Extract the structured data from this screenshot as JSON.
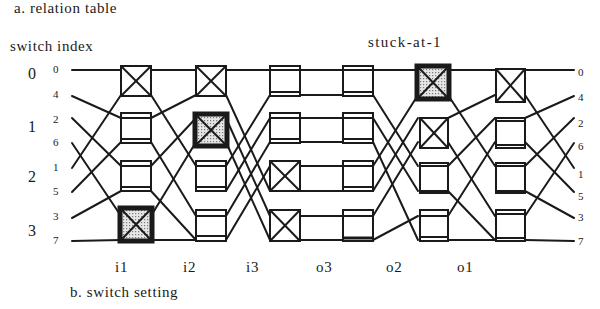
{
  "titles": {
    "relation_table": "a. relation table",
    "switch_index": "switch index",
    "fault": "stuck-at-1",
    "switch_setting": "b. switch setting"
  },
  "switch_indices": [
    "0",
    "1",
    "2",
    "3"
  ],
  "left_wire_labels": [
    "0",
    "4",
    "2",
    "6",
    "1",
    "5",
    "3",
    "7"
  ],
  "right_wire_labels": [
    "0",
    "4",
    "2",
    "6",
    "1",
    "5",
    "3",
    "7"
  ],
  "stages": [
    "i1",
    "i2",
    "i3",
    "o3",
    "o2",
    "o1"
  ],
  "switch_states": {
    "i1": [
      "cross",
      "straight",
      "straight",
      "cross-faulty"
    ],
    "i2": [
      "cross",
      "cross-faulty",
      "straight",
      "straight"
    ],
    "i3": [
      "straight",
      "straight",
      "cross",
      "cross"
    ],
    "o3": [
      "straight",
      "straight",
      "straight",
      "straight"
    ],
    "o2": [
      "cross-faulty",
      "cross",
      "straight",
      "straight"
    ],
    "o1": [
      "cross",
      "straight",
      "straight",
      "straight"
    ]
  },
  "colors": {
    "line": "#1a1a1a",
    "faulty_fill": "#c8c8c8"
  }
}
